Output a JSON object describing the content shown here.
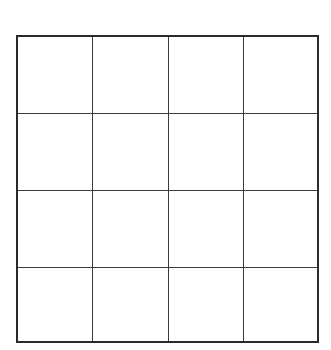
{
  "diagram": {
    "type": "grid",
    "rows": 4,
    "columns": 4,
    "cells": [
      [
        "",
        "",
        "",
        ""
      ],
      [
        "",
        "",
        "",
        ""
      ],
      [
        "",
        "",
        "",
        ""
      ],
      [
        "",
        "",
        "",
        ""
      ]
    ],
    "line_color": "#2a2a2a",
    "background": "#ffffff"
  }
}
